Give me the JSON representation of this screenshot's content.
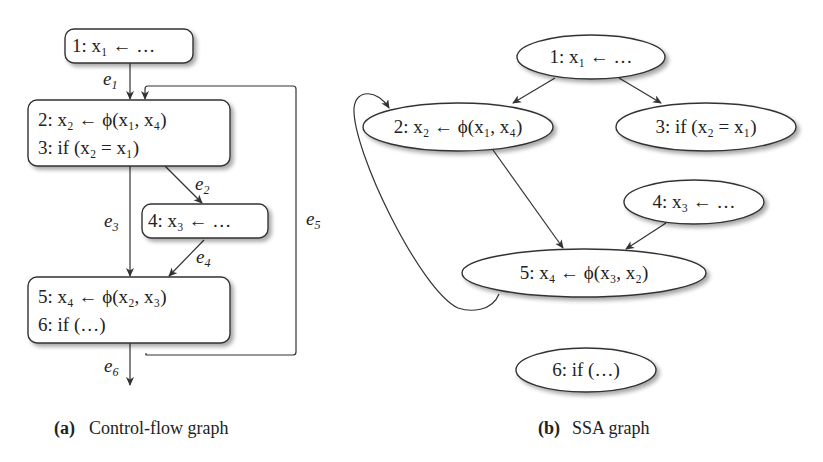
{
  "figure_a": {
    "caption_tag": "(a)",
    "caption_text": "Control-flow graph",
    "nodes": [
      {
        "id": "B1",
        "lines": [
          "1: x₁ ← …"
        ]
      },
      {
        "id": "B2",
        "lines": [
          "2: x₂ ← ϕ(x₁, x₄)",
          "3: if (x₂ = x₁)"
        ]
      },
      {
        "id": "B3",
        "lines": [
          "4: x₃ ← …"
        ]
      },
      {
        "id": "B4",
        "lines": [
          "5: x₄ ← ϕ(x₂, x₃)",
          "6: if (…)"
        ]
      }
    ],
    "edges": [
      {
        "label": "e1",
        "from": "B1",
        "to": "B2"
      },
      {
        "label": "e2",
        "from": "B2",
        "to": "B3"
      },
      {
        "label": "e3",
        "from": "B2",
        "to": "B4"
      },
      {
        "label": "e4",
        "from": "B3",
        "to": "B4"
      },
      {
        "label": "e5",
        "from": "B4",
        "to": "B2"
      },
      {
        "label": "e6",
        "from": "B4",
        "to": "exit"
      }
    ]
  },
  "figure_b": {
    "caption_tag": "(b)",
    "caption_text": "SSA graph",
    "nodes": [
      {
        "id": "1",
        "label": "1: x₁ ← …"
      },
      {
        "id": "2",
        "label": "2: x₂ ← ϕ(x₁, x₄)"
      },
      {
        "id": "3",
        "label": "3: if (x₂ = x₁)"
      },
      {
        "id": "4",
        "label": "4: x₃ ← …"
      },
      {
        "id": "5",
        "label": "5: x₄ ← ϕ(x₃, x₂)"
      },
      {
        "id": "6",
        "label": "6: if (…)"
      }
    ],
    "edges": [
      {
        "from": "1",
        "to": "2"
      },
      {
        "from": "1",
        "to": "3"
      },
      {
        "from": "2",
        "to": "5"
      },
      {
        "from": "4",
        "to": "5"
      },
      {
        "from": "5",
        "to": "2"
      }
    ]
  }
}
